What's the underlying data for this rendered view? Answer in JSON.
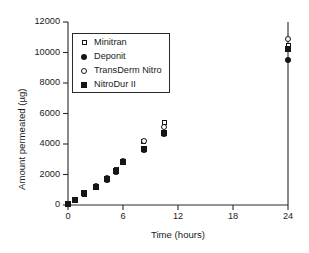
{
  "chart_data": {
    "type": "scatter",
    "title": "",
    "xlabel": "Time (hours)",
    "ylabel": "Amount permeated (µg)",
    "xlim": [
      0,
      24
    ],
    "ylim": [
      0,
      12000
    ],
    "xticks": [
      0,
      6,
      12,
      18,
      24
    ],
    "yticks": [
      0,
      2000,
      4000,
      6000,
      8000,
      10000,
      12000
    ],
    "xtick_labels": [
      "0",
      "6",
      "12",
      "18",
      "24"
    ],
    "ytick_labels": [
      "0",
      "2000",
      "4000",
      "6000",
      "8000",
      "10000",
      "12000"
    ],
    "grid": false,
    "legend_position": "upper-left-inside",
    "x": [
      0,
      0.75,
      1.75,
      3,
      4.25,
      5.25,
      6,
      8.25,
      10.5,
      24
    ],
    "series": [
      {
        "name": "Minitran",
        "marker": "open-square",
        "values": [
          60,
          290,
          680,
          1200,
          1680,
          2300,
          2880,
          4150,
          5400,
          10450
        ]
      },
      {
        "name": "Deponit",
        "marker": "filled-circle",
        "values": [
          50,
          310,
          720,
          1180,
          1640,
          2180,
          2800,
          3620,
          4680,
          9500
        ]
      },
      {
        "name": "TransDerm Nitro",
        "marker": "open-circle",
        "values": [
          70,
          330,
          760,
          1230,
          1740,
          2280,
          2900,
          4180,
          5100,
          10900
        ]
      },
      {
        "name": "NitroDur II",
        "marker": "filled-square",
        "values": [
          55,
          300,
          800,
          1210,
          1700,
          2200,
          2850,
          3680,
          4750,
          10250
        ]
      }
    ]
  },
  "legend": {
    "items": [
      {
        "label": "Minitran",
        "marker": "open-square"
      },
      {
        "label": "Deponit",
        "marker": "filled-circle"
      },
      {
        "label": "TransDerm Nitro",
        "marker": "open-circle"
      },
      {
        "label": "NitroDur II",
        "marker": "filled-square"
      }
    ]
  },
  "axes": {
    "frame_color": "#2a2a2a",
    "text_color": "#1a1a1a"
  }
}
